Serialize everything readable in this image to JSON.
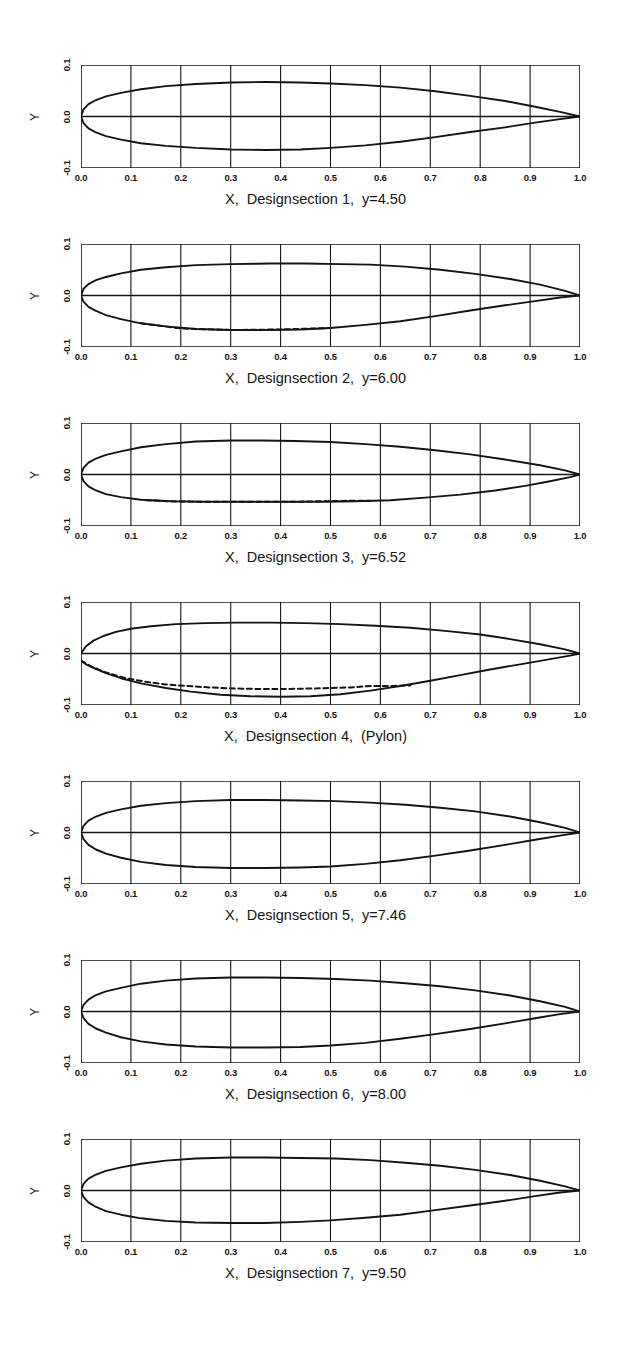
{
  "figure": {
    "kind": "airfoil-section-plots",
    "panel_count": 7,
    "background_color": "#ffffff",
    "line_color": "#141414"
  },
  "axes": {
    "x_label_prefix": "X",
    "y_label": "Y",
    "x_ticks": [
      "0.0",
      "0.1",
      "0.2",
      "0.3",
      "0.4",
      "0.5",
      "0.6",
      "0.7",
      "0.8",
      "0.9",
      "1.0"
    ],
    "y_ticks": [
      "0.1",
      "0.0",
      "-0.1"
    ],
    "xlim": [
      0.0,
      1.0
    ],
    "ylim": [
      -0.1,
      0.1
    ],
    "grid": true
  },
  "chart_data": [
    {
      "type": "line",
      "title": "X,  Designsection 1,  y=4.50",
      "panel_index": 1,
      "section": "1",
      "y_station": "4.50",
      "xlabel": "X,  Designsection 1,  y=4.50",
      "ylabel": "Y",
      "xlim": [
        0.0,
        1.0
      ],
      "ylim": [
        -0.1,
        0.1
      ],
      "grid": true,
      "series": [
        {
          "name": "upper-surface",
          "style": "solid",
          "x": [
            0.0,
            0.005,
            0.015,
            0.03,
            0.05,
            0.08,
            0.12,
            0.17,
            0.23,
            0.3,
            0.37,
            0.44,
            0.5,
            0.57,
            0.64,
            0.71,
            0.78,
            0.85,
            0.91,
            0.96,
            1.0
          ],
          "y": [
            0.0,
            0.014,
            0.024,
            0.032,
            0.039,
            0.046,
            0.053,
            0.059,
            0.063,
            0.066,
            0.067,
            0.066,
            0.064,
            0.061,
            0.056,
            0.049,
            0.04,
            0.03,
            0.019,
            0.009,
            0.0
          ]
        },
        {
          "name": "lower-surface",
          "style": "solid",
          "x": [
            0.0,
            0.005,
            0.015,
            0.03,
            0.05,
            0.08,
            0.12,
            0.17,
            0.23,
            0.3,
            0.37,
            0.44,
            0.5,
            0.57,
            0.64,
            0.71,
            0.78,
            0.85,
            0.91,
            0.96,
            1.0
          ],
          "y": [
            0.0,
            -0.013,
            -0.023,
            -0.031,
            -0.038,
            -0.045,
            -0.052,
            -0.057,
            -0.061,
            -0.064,
            -0.065,
            -0.064,
            -0.061,
            -0.056,
            -0.049,
            -0.04,
            -0.03,
            -0.021,
            -0.012,
            -0.005,
            0.0
          ]
        }
      ]
    },
    {
      "type": "line",
      "title": "X,  Designsection 2,  y=6.00",
      "panel_index": 2,
      "section": "2",
      "y_station": "6.00",
      "xlabel": "X,  Designsection 2,  y=6.00",
      "ylabel": "Y",
      "xlim": [
        0.0,
        1.0
      ],
      "ylim": [
        -0.1,
        0.1
      ],
      "grid": true,
      "series": [
        {
          "name": "upper-surface",
          "style": "solid",
          "x": [
            0.0,
            0.005,
            0.015,
            0.03,
            0.05,
            0.08,
            0.12,
            0.17,
            0.23,
            0.3,
            0.38,
            0.45,
            0.52,
            0.58,
            0.65,
            0.72,
            0.79,
            0.86,
            0.92,
            0.97,
            1.0
          ],
          "y": [
            0.0,
            0.013,
            0.022,
            0.03,
            0.036,
            0.043,
            0.05,
            0.055,
            0.059,
            0.061,
            0.062,
            0.062,
            0.061,
            0.06,
            0.056,
            0.05,
            0.042,
            0.032,
            0.021,
            0.009,
            0.0
          ]
        },
        {
          "name": "lower-surface",
          "style": "solid",
          "x": [
            0.0,
            0.005,
            0.015,
            0.03,
            0.05,
            0.08,
            0.12,
            0.17,
            0.23,
            0.3,
            0.37,
            0.44,
            0.5,
            0.57,
            0.64,
            0.71,
            0.78,
            0.85,
            0.91,
            0.96,
            1.0
          ],
          "y": [
            0.0,
            -0.012,
            -0.022,
            -0.03,
            -0.038,
            -0.046,
            -0.054,
            -0.06,
            -0.065,
            -0.067,
            -0.067,
            -0.066,
            -0.063,
            -0.057,
            -0.05,
            -0.04,
            -0.029,
            -0.019,
            -0.011,
            -0.004,
            0.0
          ]
        },
        {
          "name": "lower-surface-alt",
          "style": "dashed",
          "x": [
            0.12,
            0.2,
            0.3,
            0.4,
            0.5
          ],
          "y": [
            -0.054,
            -0.064,
            -0.067,
            -0.066,
            -0.063
          ]
        }
      ]
    },
    {
      "type": "line",
      "title": "X,  Designsection 3,  y=6.52",
      "panel_index": 3,
      "section": "3",
      "y_station": "6.52",
      "xlabel": "X,  Designsection 3,  y=6.52",
      "ylabel": "Y",
      "xlim": [
        0.0,
        1.0
      ],
      "ylim": [
        -0.1,
        0.1
      ],
      "grid": true,
      "series": [
        {
          "name": "upper-surface",
          "style": "solid",
          "x": [
            0.0,
            0.005,
            0.015,
            0.03,
            0.05,
            0.08,
            0.12,
            0.17,
            0.23,
            0.3,
            0.36,
            0.43,
            0.5,
            0.57,
            0.64,
            0.71,
            0.78,
            0.85,
            0.92,
            0.97,
            1.0
          ],
          "y": [
            0.0,
            0.013,
            0.023,
            0.031,
            0.038,
            0.045,
            0.053,
            0.059,
            0.064,
            0.066,
            0.066,
            0.065,
            0.063,
            0.059,
            0.054,
            0.047,
            0.039,
            0.029,
            0.018,
            0.008,
            0.0
          ]
        },
        {
          "name": "lower-surface",
          "style": "solid",
          "x": [
            0.0,
            0.005,
            0.015,
            0.03,
            0.05,
            0.08,
            0.12,
            0.18,
            0.25,
            0.33,
            0.4,
            0.48,
            0.55,
            0.62,
            0.69,
            0.76,
            0.83,
            0.89,
            0.94,
            0.98,
            1.0
          ],
          "y": [
            0.0,
            -0.013,
            -0.023,
            -0.031,
            -0.038,
            -0.044,
            -0.049,
            -0.052,
            -0.053,
            -0.053,
            -0.053,
            -0.053,
            -0.052,
            -0.05,
            -0.045,
            -0.039,
            -0.031,
            -0.022,
            -0.013,
            -0.005,
            0.0
          ]
        },
        {
          "name": "lower-surface-alt",
          "style": "dashed",
          "x": [
            0.13,
            0.18,
            0.24,
            0.3,
            0.36,
            0.42,
            0.48,
            0.54,
            0.58
          ],
          "y": [
            -0.05,
            -0.052,
            -0.053,
            -0.053,
            -0.053,
            -0.053,
            -0.052,
            -0.051,
            -0.051
          ]
        }
      ]
    },
    {
      "type": "line",
      "title": "X,  Designsection 4,  (Pylon)",
      "panel_index": 4,
      "section": "4",
      "y_station": "(Pylon)",
      "xlabel": "X,  Designsection 4,  (Pylon)",
      "ylabel": "Y",
      "xlim": [
        0.0,
        1.0
      ],
      "ylim": [
        -0.1,
        0.1
      ],
      "grid": true,
      "series": [
        {
          "name": "upper-surface",
          "style": "solid",
          "x": [
            0.0,
            0.01,
            0.025,
            0.045,
            0.07,
            0.1,
            0.14,
            0.19,
            0.25,
            0.31,
            0.38,
            0.45,
            0.52,
            0.59,
            0.66,
            0.73,
            0.8,
            0.86,
            0.92,
            0.97,
            1.0
          ],
          "y": [
            0.0,
            0.014,
            0.025,
            0.034,
            0.042,
            0.048,
            0.053,
            0.057,
            0.059,
            0.06,
            0.06,
            0.059,
            0.057,
            0.054,
            0.05,
            0.044,
            0.037,
            0.028,
            0.018,
            0.008,
            0.0
          ]
        },
        {
          "name": "lower-surface",
          "style": "solid",
          "x": [
            0.0,
            0.01,
            0.025,
            0.05,
            0.08,
            0.12,
            0.17,
            0.22,
            0.28,
            0.34,
            0.4,
            0.46,
            0.52,
            0.58,
            0.64,
            0.7,
            0.76,
            0.82,
            0.88,
            0.94,
            0.98,
            1.0
          ],
          "y": [
            -0.014,
            -0.021,
            -0.028,
            -0.038,
            -0.048,
            -0.058,
            -0.067,
            -0.074,
            -0.08,
            -0.083,
            -0.084,
            -0.083,
            -0.079,
            -0.072,
            -0.063,
            -0.053,
            -0.042,
            -0.031,
            -0.021,
            -0.011,
            -0.004,
            0.0
          ]
        },
        {
          "name": "lower-surface-alt",
          "style": "dashed",
          "x": [
            0.0,
            0.02,
            0.05,
            0.09,
            0.13,
            0.17,
            0.21,
            0.26,
            0.31,
            0.36,
            0.41,
            0.46,
            0.5,
            0.54,
            0.58,
            0.62,
            0.66
          ],
          "y": [
            -0.014,
            -0.025,
            -0.037,
            -0.048,
            -0.055,
            -0.06,
            -0.063,
            -0.066,
            -0.068,
            -0.069,
            -0.069,
            -0.068,
            -0.067,
            -0.066,
            -0.063,
            -0.063,
            -0.062
          ]
        }
      ]
    },
    {
      "type": "line",
      "title": "X,  Designsection 5,  y=7.46",
      "panel_index": 5,
      "section": "5",
      "y_station": "7.46",
      "xlabel": "X,  Designsection 5,  y=7.46",
      "ylabel": "Y",
      "xlim": [
        0.0,
        1.0
      ],
      "ylim": [
        -0.1,
        0.1
      ],
      "grid": true,
      "series": [
        {
          "name": "upper-surface",
          "style": "solid",
          "x": [
            0.0,
            0.005,
            0.015,
            0.03,
            0.05,
            0.08,
            0.12,
            0.17,
            0.23,
            0.3,
            0.37,
            0.44,
            0.51,
            0.58,
            0.65,
            0.72,
            0.79,
            0.86,
            0.92,
            0.97,
            1.0
          ],
          "y": [
            0.0,
            0.013,
            0.023,
            0.031,
            0.038,
            0.045,
            0.052,
            0.057,
            0.061,
            0.063,
            0.063,
            0.062,
            0.061,
            0.058,
            0.054,
            0.048,
            0.041,
            0.031,
            0.02,
            0.009,
            0.0
          ]
        },
        {
          "name": "lower-surface",
          "style": "solid",
          "x": [
            0.0,
            0.005,
            0.015,
            0.03,
            0.05,
            0.08,
            0.12,
            0.17,
            0.23,
            0.3,
            0.37,
            0.44,
            0.5,
            0.57,
            0.64,
            0.71,
            0.78,
            0.85,
            0.91,
            0.96,
            1.0
          ],
          "y": [
            0.0,
            -0.013,
            -0.024,
            -0.033,
            -0.041,
            -0.049,
            -0.057,
            -0.063,
            -0.067,
            -0.069,
            -0.069,
            -0.068,
            -0.066,
            -0.061,
            -0.054,
            -0.045,
            -0.035,
            -0.024,
            -0.014,
            -0.006,
            0.0
          ]
        }
      ]
    },
    {
      "type": "line",
      "title": "X,  Designsection 6,  y=8.00",
      "panel_index": 6,
      "section": "6",
      "y_station": "8.00",
      "xlabel": "X,  Designsection 6,  y=8.00",
      "ylabel": "Y",
      "xlim": [
        0.0,
        1.0
      ],
      "ylim": [
        -0.1,
        0.1
      ],
      "grid": true,
      "series": [
        {
          "name": "upper-surface",
          "style": "solid",
          "x": [
            0.0,
            0.005,
            0.015,
            0.03,
            0.05,
            0.08,
            0.12,
            0.17,
            0.23,
            0.3,
            0.37,
            0.44,
            0.51,
            0.58,
            0.65,
            0.72,
            0.79,
            0.86,
            0.92,
            0.97,
            1.0
          ],
          "y": [
            0.0,
            0.013,
            0.023,
            0.032,
            0.039,
            0.046,
            0.054,
            0.06,
            0.064,
            0.066,
            0.066,
            0.065,
            0.063,
            0.06,
            0.055,
            0.049,
            0.041,
            0.031,
            0.02,
            0.009,
            0.0
          ]
        },
        {
          "name": "lower-surface",
          "style": "solid",
          "x": [
            0.0,
            0.005,
            0.015,
            0.03,
            0.05,
            0.08,
            0.12,
            0.17,
            0.23,
            0.3,
            0.37,
            0.44,
            0.5,
            0.57,
            0.64,
            0.71,
            0.78,
            0.85,
            0.91,
            0.96,
            1.0
          ],
          "y": [
            0.0,
            -0.013,
            -0.024,
            -0.033,
            -0.041,
            -0.05,
            -0.058,
            -0.064,
            -0.068,
            -0.07,
            -0.07,
            -0.069,
            -0.066,
            -0.061,
            -0.053,
            -0.044,
            -0.034,
            -0.023,
            -0.013,
            -0.005,
            0.0
          ]
        }
      ]
    },
    {
      "type": "line",
      "title": "X,  Designsection 7,  y=9.50",
      "panel_index": 7,
      "section": "7",
      "y_station": "9.50",
      "xlabel": "X,  Designsection 7,  y=9.50",
      "ylabel": "Y",
      "xlim": [
        0.0,
        1.0
      ],
      "ylim": [
        -0.1,
        0.1
      ],
      "grid": true,
      "series": [
        {
          "name": "upper-surface",
          "style": "solid",
          "x": [
            0.0,
            0.005,
            0.015,
            0.03,
            0.05,
            0.08,
            0.12,
            0.17,
            0.23,
            0.3,
            0.37,
            0.44,
            0.51,
            0.58,
            0.65,
            0.72,
            0.79,
            0.86,
            0.92,
            0.97,
            1.0
          ],
          "y": [
            0.0,
            0.013,
            0.023,
            0.031,
            0.038,
            0.045,
            0.052,
            0.058,
            0.062,
            0.064,
            0.064,
            0.063,
            0.062,
            0.059,
            0.054,
            0.048,
            0.04,
            0.03,
            0.019,
            0.008,
            0.0
          ]
        },
        {
          "name": "lower-surface",
          "style": "solid",
          "x": [
            0.0,
            0.005,
            0.015,
            0.03,
            0.05,
            0.08,
            0.12,
            0.17,
            0.23,
            0.3,
            0.37,
            0.44,
            0.5,
            0.57,
            0.64,
            0.71,
            0.78,
            0.85,
            0.91,
            0.96,
            1.0
          ],
          "y": [
            0.0,
            -0.013,
            -0.023,
            -0.032,
            -0.04,
            -0.047,
            -0.054,
            -0.059,
            -0.062,
            -0.063,
            -0.063,
            -0.061,
            -0.058,
            -0.053,
            -0.047,
            -0.038,
            -0.029,
            -0.02,
            -0.011,
            -0.004,
            0.0
          ]
        }
      ]
    }
  ]
}
